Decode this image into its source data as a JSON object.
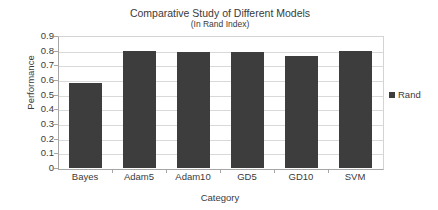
{
  "chart_data": {
    "type": "bar",
    "title": "Comparative Study of Different Models",
    "subtitle": "(In Rand Index)",
    "xlabel": "Category",
    "ylabel": "Performance",
    "categories": [
      "Bayes",
      "Adam5",
      "Adam10",
      "GD5",
      "GD10",
      "SVM"
    ],
    "series": [
      {
        "name": "Rand",
        "color": "#3d3d3d",
        "values": [
          0.58,
          0.795,
          0.793,
          0.79,
          0.765,
          0.8
        ]
      }
    ],
    "ylim": [
      0,
      0.9
    ],
    "ytick_labels": [
      "0.9",
      "0.8",
      "0.7",
      "0.6",
      "0.5",
      "0.4",
      "0.3",
      "0.2",
      "0.1",
      "0"
    ],
    "ytick_values": [
      0.9,
      0.8,
      0.7,
      0.6,
      0.5,
      0.4,
      0.3,
      0.2,
      0.1,
      0
    ],
    "grid": true,
    "legend_position": "right",
    "legend_entries": [
      "Rand"
    ],
    "plot_background": "#ffffff",
    "grid_color": "#d9d9d9",
    "axis_color": "#a6a6a6"
  }
}
